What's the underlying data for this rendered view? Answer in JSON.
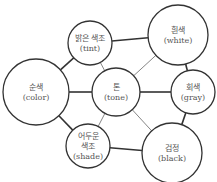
{
  "diagram": {
    "title": "",
    "colors": {
      "stroke": "#333333",
      "text": "#555555",
      "background": "#ffffff"
    },
    "nodes": [
      {
        "id": "tint",
        "cx": 90,
        "cy": 43,
        "r": 22,
        "lines": [
          "밝은 색조",
          "(tint)"
        ]
      },
      {
        "id": "white",
        "cx": 178,
        "cy": 35,
        "r": 30,
        "lines": [
          "흰색",
          "(white)"
        ]
      },
      {
        "id": "color",
        "cx": 36,
        "cy": 92,
        "r": 33,
        "lines": [
          "순색",
          "(color)"
        ]
      },
      {
        "id": "tone",
        "cx": 116,
        "cy": 92,
        "r": 24,
        "lines": [
          "톤",
          "(tone)"
        ]
      },
      {
        "id": "gray",
        "cx": 193,
        "cy": 92,
        "r": 22,
        "lines": [
          "회색",
          "(gray)"
        ]
      },
      {
        "id": "shade",
        "cx": 88,
        "cy": 146,
        "r": 22,
        "lines": [
          "어두운",
          "색조",
          "(shade)"
        ]
      },
      {
        "id": "black",
        "cx": 172,
        "cy": 153,
        "r": 30,
        "lines": [
          "검정",
          "(black)"
        ]
      }
    ],
    "edges": [
      {
        "from": "tint",
        "to": "white",
        "weight": "thick"
      },
      {
        "from": "tint",
        "to": "color",
        "weight": "thick"
      },
      {
        "from": "white",
        "to": "gray",
        "weight": "thick"
      },
      {
        "from": "color",
        "to": "tone",
        "weight": "thick"
      },
      {
        "from": "tone",
        "to": "gray",
        "weight": "thick"
      },
      {
        "from": "color",
        "to": "shade",
        "weight": "thick"
      },
      {
        "from": "shade",
        "to": "black",
        "weight": "thick"
      },
      {
        "from": "gray",
        "to": "black",
        "weight": "thick"
      },
      {
        "from": "tint",
        "to": "tone",
        "weight": "thin"
      },
      {
        "from": "white",
        "to": "tone",
        "weight": "thin"
      },
      {
        "from": "shade",
        "to": "tone",
        "weight": "thin"
      },
      {
        "from": "black",
        "to": "tone",
        "weight": "thin"
      }
    ]
  }
}
